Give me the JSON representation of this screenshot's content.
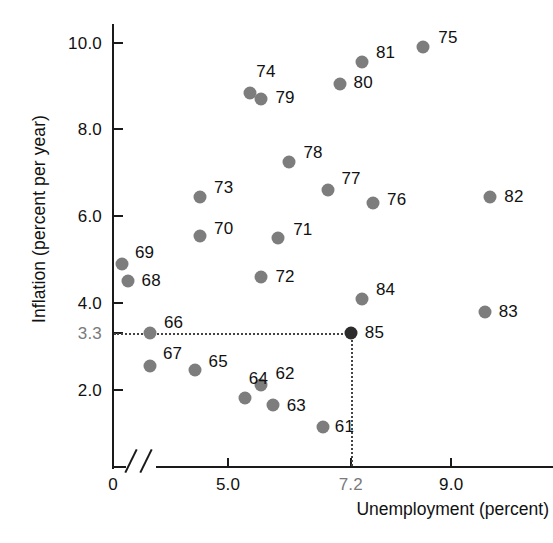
{
  "chart_data": {
    "type": "scatter",
    "title": "",
    "xlabel": "Unemployment (percent)",
    "ylabel": "Inflation (percent per year)",
    "xlim": [
      0,
      9.8
    ],
    "ylim": [
      0,
      10.6
    ],
    "x_ticks": [
      "0",
      "5.0",
      "7.2",
      "9.0"
    ],
    "x_tick_values": [
      0,
      5.0,
      7.2,
      9.0
    ],
    "y_ticks": [
      "2.0",
      "3.3",
      "4.0",
      "6.0",
      "8.0",
      "10.0"
    ],
    "y_tick_values": [
      2.0,
      3.3,
      4.0,
      6.0,
      8.0,
      10.0
    ],
    "grid": false,
    "legend": "none",
    "axis_break_x": true,
    "highlight_point": "85",
    "reference_lines": {
      "horizontal_value": 3.3,
      "vertical_value": 7.2
    },
    "point_label_key": "year (two-digit)",
    "points": [
      {
        "label": "61",
        "x": 6.7,
        "y": 1.15
      },
      {
        "label": "62",
        "x": 5.6,
        "y": 2.1
      },
      {
        "label": "63",
        "x": 5.8,
        "y": 1.65
      },
      {
        "label": "64",
        "x": 5.3,
        "y": 1.8
      },
      {
        "label": "65",
        "x": 4.4,
        "y": 2.45
      },
      {
        "label": "66",
        "x": 3.6,
        "y": 3.3
      },
      {
        "label": "67",
        "x": 3.6,
        "y": 2.55
      },
      {
        "label": "68",
        "x": 3.2,
        "y": 4.5
      },
      {
        "label": "69",
        "x": 3.1,
        "y": 4.9
      },
      {
        "label": "70",
        "x": 4.5,
        "y": 5.55
      },
      {
        "label": "71",
        "x": 5.9,
        "y": 5.5
      },
      {
        "label": "72",
        "x": 5.6,
        "y": 4.6
      },
      {
        "label": "73",
        "x": 4.5,
        "y": 6.45
      },
      {
        "label": "74",
        "x": 5.4,
        "y": 8.85
      },
      {
        "label": "75",
        "x": 8.5,
        "y": 9.9
      },
      {
        "label": "76",
        "x": 7.6,
        "y": 6.3
      },
      {
        "label": "77",
        "x": 6.8,
        "y": 6.6
      },
      {
        "label": "78",
        "x": 6.1,
        "y": 7.25
      },
      {
        "label": "79",
        "x": 5.6,
        "y": 8.7
      },
      {
        "label": "80",
        "x": 7.0,
        "y": 9.05
      },
      {
        "label": "81",
        "x": 7.4,
        "y": 9.55
      },
      {
        "label": "82",
        "x": 9.7,
        "y": 6.45
      },
      {
        "label": "83",
        "x": 9.6,
        "y": 3.8
      },
      {
        "label": "84",
        "x": 7.4,
        "y": 4.1
      },
      {
        "label": "85",
        "x": 7.2,
        "y": 3.3
      }
    ]
  },
  "colors": {
    "point": "#7d7d7d",
    "point_highlight": "#2b2b2b",
    "axis": "#1a1a1a",
    "guide": "#444444",
    "muted_label": "#7a7a7a",
    "background": "#ffffff"
  }
}
